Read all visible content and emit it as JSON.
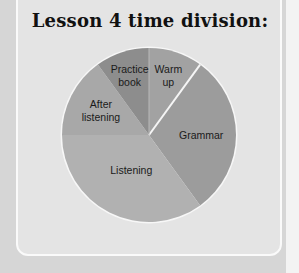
{
  "chart_data": {
    "type": "pie",
    "title": "Lesson 4 time division:",
    "categories": [
      "Warm up",
      "Grammar",
      "Listening",
      "After listening",
      "Practice book"
    ],
    "values": [
      10,
      30,
      35,
      15,
      10
    ],
    "unit": "percent (estimated from slice angles)",
    "start_angle_deg": 0,
    "direction": "clockwise",
    "colors": [
      "#a2a2a2",
      "#9c9c9c",
      "#b1b1b1",
      "#a8a8a8",
      "#8d8d8d"
    ],
    "legend": "none (labels inside slices)",
    "label_lines": [
      [
        "Warm",
        "up"
      ],
      [
        "Grammar"
      ],
      [
        "Listening"
      ],
      [
        "After",
        "listening"
      ],
      [
        "Practice",
        "book"
      ]
    ]
  },
  "page": {
    "title": "Lesson 4 time division:",
    "background": "#d6d6d6",
    "card_background": "#e4e4e4",
    "card_border": "#fafafa"
  }
}
